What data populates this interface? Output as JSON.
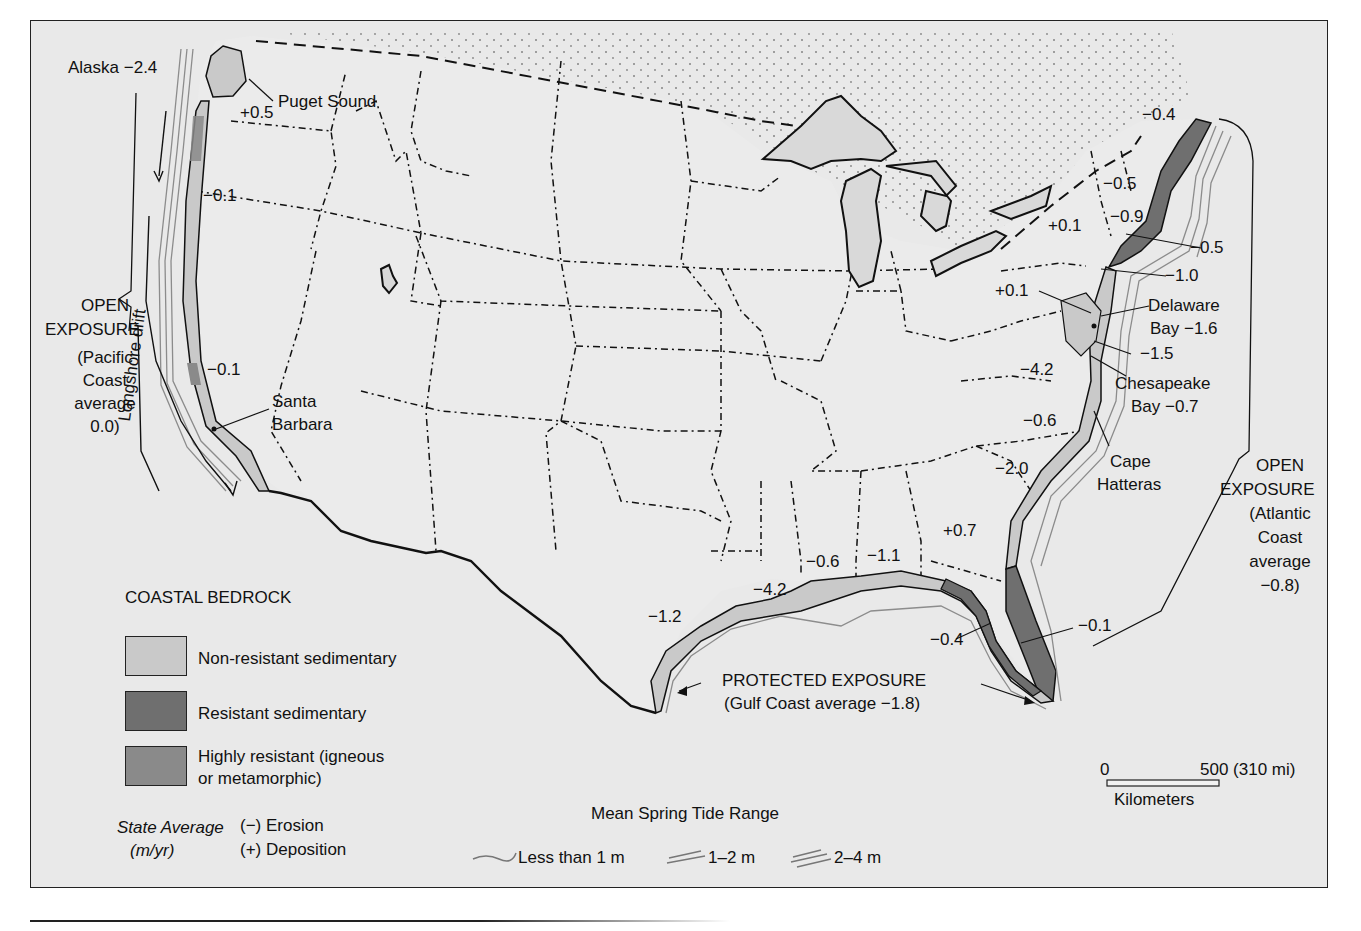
{
  "map": {
    "type": "annotated-map",
    "subject": "US coastal erosion/deposition rates, coastal bedrock, and tide range",
    "colors": {
      "background": "#e9e9e9",
      "non_resistant": "#c9c9c9",
      "resistant": "#6f6f6f",
      "highly_resistant": "#8a8a8a",
      "lakes": "#d8d8d8",
      "line": "#111111",
      "tide_line": "#8c8c8c"
    },
    "labels": {
      "alaska": "Alaska −2.4",
      "puget_sound": "Puget Sound",
      "wa": "+0.5",
      "or": "−0.1",
      "ca_central": "−0.1",
      "santa_barbara_1": "Santa",
      "santa_barbara_2": "Barbara",
      "pacific_open_1": "OPEN",
      "pacific_open_2": "EXPOSURE",
      "pacific_avg_1": "(Pacific",
      "pacific_avg_2": "Coast",
      "pacific_avg_3": "average",
      "pacific_avg_4": "0.0)",
      "longshore": "Longshore drift",
      "me": "−0.4",
      "nh": "−0.5",
      "ma": "−0.9",
      "ri": "−0.5",
      "ny_ct": "−1.0",
      "pa": "+0.1",
      "nj_md": "+0.1",
      "delaware_1": "Delaware",
      "delaware_2": "Bay −1.6",
      "md": "−1.5",
      "chesapeake_1": "Chesapeake",
      "chesapeake_2": "Bay −0.7",
      "va": "−4.2",
      "nc": "−0.6",
      "sc": "−2.0",
      "cape_hatteras_1": "Cape",
      "cape_hatteras_2": "Hatteras",
      "ga": "+0.7",
      "atlantic_open_1": "OPEN",
      "atlantic_open_2": "EXPOSURE",
      "atlantic_avg_1": "(Atlantic",
      "atlantic_avg_2": "Coast",
      "atlantic_avg_3": "average",
      "atlantic_avg_4": "−0.8)",
      "fl_east": "−0.1",
      "fl_west": "−0.4",
      "al": "−1.1",
      "ms": "−0.6",
      "la": "−4.2",
      "tx": "−1.2",
      "gulf_1": "PROTECTED EXPOSURE",
      "gulf_2": "(Gulf Coast average −1.8)"
    },
    "state_averages_m_per_yr": [
      {
        "place": "Alaska",
        "value": -2.4
      },
      {
        "place": "Washington",
        "value": 0.5
      },
      {
        "place": "Oregon",
        "value": -0.1
      },
      {
        "place": "California",
        "value": -0.1
      },
      {
        "place": "Maine",
        "value": -0.4
      },
      {
        "place": "New Hampshire",
        "value": -0.5
      },
      {
        "place": "Massachusetts",
        "value": -0.9
      },
      {
        "place": "Rhode Island",
        "value": -0.5
      },
      {
        "place": "New York/Connecticut",
        "value": -1.0
      },
      {
        "place": "Pennsylvania",
        "value": 0.1
      },
      {
        "place": "New Jersey",
        "value": 0.1
      },
      {
        "place": "Delaware Bay",
        "value": -1.6
      },
      {
        "place": "Maryland",
        "value": -1.5
      },
      {
        "place": "Chesapeake Bay",
        "value": -0.7
      },
      {
        "place": "Virginia",
        "value": -4.2
      },
      {
        "place": "North Carolina",
        "value": -0.6
      },
      {
        "place": "South Carolina",
        "value": -2.0
      },
      {
        "place": "Georgia",
        "value": 0.7
      },
      {
        "place": "Florida (Atlantic)",
        "value": -0.1
      },
      {
        "place": "Florida (Gulf)",
        "value": -0.4
      },
      {
        "place": "Alabama",
        "value": -1.1
      },
      {
        "place": "Mississippi",
        "value": -0.6
      },
      {
        "place": "Louisiana",
        "value": -4.2
      },
      {
        "place": "Texas",
        "value": -1.2
      }
    ],
    "coast_averages_m_per_yr": [
      {
        "coast": "Pacific",
        "exposure": "Open",
        "value": 0.0
      },
      {
        "coast": "Atlantic",
        "exposure": "Open",
        "value": -0.8
      },
      {
        "coast": "Gulf",
        "exposure": "Protected",
        "value": -1.8
      }
    ]
  },
  "legend": {
    "title": "COASTAL BEDROCK",
    "items": [
      {
        "label": "Non-resistant sedimentary"
      },
      {
        "label": "Resistant sedimentary"
      },
      {
        "label_1": "Highly resistant (igneous",
        "label_2": "or metamorphic)"
      }
    ],
    "state_avg_1": "State Average",
    "state_avg_2": "(m/yr)",
    "erosion": "(−) Erosion",
    "deposition": "(+) Deposition",
    "tide_title": "Mean Spring Tide Range",
    "tide_items": [
      "Less than 1 m",
      "1–2 m",
      "2–4 m"
    ]
  },
  "scale": {
    "zero": "0",
    "max": "500 (310 mi)",
    "unit": "Kilometers"
  }
}
